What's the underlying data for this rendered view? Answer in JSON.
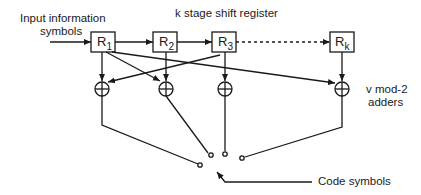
{
  "diagram": {
    "title": "k stage shift register",
    "input_label_line1": "Input information",
    "input_label_line2": "symbols",
    "adders_label_line1": "v mod-2",
    "adders_label_line2": "adders",
    "output_label": "Code symbols",
    "registers": [
      {
        "name": "R",
        "sub": "1"
      },
      {
        "name": "R",
        "sub": "2"
      },
      {
        "name": "R",
        "sub": "3"
      },
      {
        "name": "R",
        "sub": "k"
      }
    ],
    "adder_symbol": "⊕",
    "colors": {
      "stroke": "#1a1a1a",
      "background": "#ffffff"
    }
  }
}
